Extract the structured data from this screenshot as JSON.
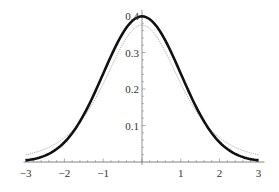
{
  "chart_data": {
    "type": "line",
    "title": "",
    "xlabel": "",
    "ylabel": "",
    "xlim": [
      -3,
      3
    ],
    "ylim": [
      0,
      0.4
    ],
    "grid": false,
    "legend": null,
    "x_ticks": [
      -3,
      -2,
      -1,
      1,
      2,
      3
    ],
    "x_tick_labels": [
      "−3",
      "−2",
      "−1",
      "1",
      "2",
      "3"
    ],
    "y_ticks": [
      0.1,
      0.2,
      0.3,
      0.4
    ],
    "y_tick_labels": [
      "0.1",
      "0.2",
      "0.3",
      "0.4"
    ],
    "series": [
      {
        "name": "standard normal density",
        "style": "thick-solid",
        "color": "#111111",
        "x": [
          -3,
          -2.5,
          -2,
          -1.5,
          -1,
          -0.5,
          0,
          0.5,
          1,
          1.5,
          2,
          2.5,
          3
        ],
        "values": [
          0.004,
          0.018,
          0.054,
          0.13,
          0.242,
          0.352,
          0.399,
          0.352,
          0.242,
          0.13,
          0.054,
          0.018,
          0.004
        ]
      },
      {
        "name": "heavy-tailed density (t-like)",
        "style": "thin-dotted",
        "color": "#999999",
        "x": [
          -3,
          -2.5,
          -2,
          -1.5,
          -1,
          -0.5,
          0,
          0.5,
          1,
          1.5,
          2,
          2.5,
          3
        ],
        "values": [
          0.016,
          0.03,
          0.064,
          0.127,
          0.22,
          0.322,
          0.375,
          0.322,
          0.22,
          0.127,
          0.064,
          0.03,
          0.016
        ]
      }
    ]
  }
}
